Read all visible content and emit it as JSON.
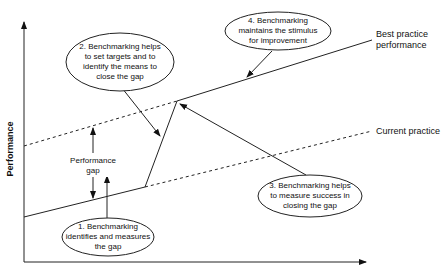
{
  "diagram": {
    "y_axis_label": "Performance",
    "lines": {
      "best_practice": "Best practice performance",
      "best_practice_line1": "Best practice",
      "best_practice_line2": "performance",
      "current_practice": "Current practice"
    },
    "gap_label_line1": "Performance",
    "gap_label_line2": "gap",
    "callouts": [
      {
        "id": 1,
        "lines": [
          "1. Benchmarking",
          "identifies and measures",
          "the gap"
        ]
      },
      {
        "id": 2,
        "lines": [
          "2.  Benchmarking helps",
          "to set targets and to",
          "identify the means to",
          "close the gap"
        ]
      },
      {
        "id": 3,
        "lines": [
          "3. Benchmarking helps",
          "to measure success in",
          "closing the gap"
        ]
      },
      {
        "id": 4,
        "lines": [
          "4. Benchmarking",
          "maintains the stimulus",
          "for improvement"
        ]
      }
    ]
  },
  "colors": {
    "line": "#222222",
    "background": "#ffffff"
  }
}
